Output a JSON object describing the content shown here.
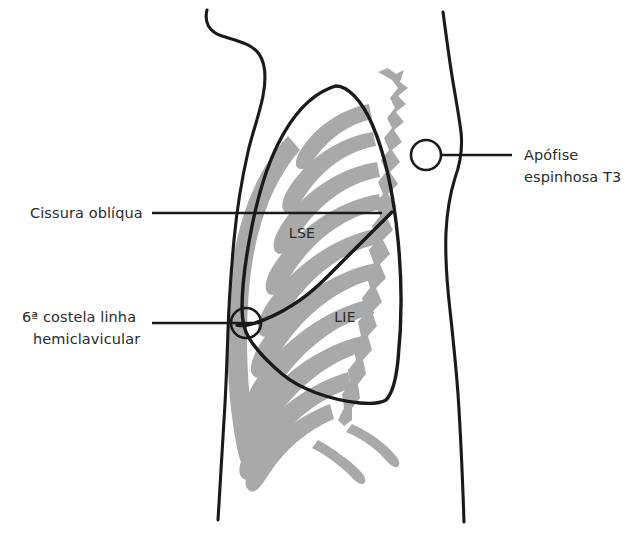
{
  "figure": {
    "view": "lateral esquerda"
  },
  "colors": {
    "ribcage_gray": "#a9a9a9",
    "outline_black": "#1a1a1a",
    "text_dark": "#2b2b2b",
    "background": "#ffffff"
  },
  "labels": [
    {
      "id": "cissura-obliqua",
      "lines": [
        "Cissura oblíqua"
      ],
      "anchor": "left",
      "text_x": 30,
      "text_y": 218,
      "leader": {
        "x1": 152,
        "y1": 213,
        "x2": 382,
        "y2": 213
      },
      "marker": "none"
    },
    {
      "id": "sexta-costela",
      "lines": [
        "6ª costela linha",
        "hemiclavicular"
      ],
      "anchor": "left",
      "text_x": 22,
      "text_y": 322,
      "leader": {
        "x1": 152,
        "y1": 323,
        "x2": 262,
        "y2": 323
      },
      "marker": "circle",
      "marker_cx": 246,
      "marker_cy": 323,
      "marker_r": 15
    },
    {
      "id": "apofise-espinhosa-t3",
      "lines": [
        "Apófise",
        "espinhosa T3"
      ],
      "anchor": "right",
      "text_x": 524,
      "text_y": 160,
      "leader": {
        "x1": 442,
        "y1": 155,
        "x2": 512,
        "y2": 155
      },
      "marker": "circle",
      "marker_cx": 426,
      "marker_cy": 155,
      "marker_r": 15
    }
  ],
  "lobes": [
    {
      "id": "lse",
      "text": "LSE",
      "x": 302,
      "y": 238,
      "full_name": "lobo superior esquerdo"
    },
    {
      "id": "lie",
      "text": "LIE",
      "x": 345,
      "y": 322,
      "full_name": "lobo inferior esquerdo"
    }
  ],
  "structures": {
    "body_outline_anterior": "anterior chest and abdominal wall contour",
    "body_outline_posterior": "posterior back and spine contour",
    "ribcage": "gray shaded ribs and vertebral column",
    "lung_border": "black outline of left lung projection",
    "oblique_fissure": "black line dividing LSE from LIE"
  }
}
